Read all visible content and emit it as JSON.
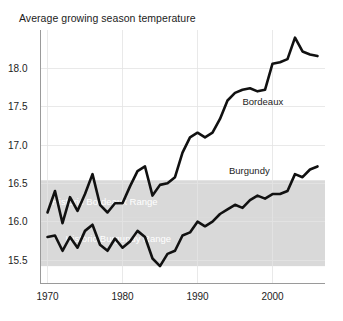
{
  "chart_data": {
    "type": "line",
    "title": "Average growing season temperature",
    "xlabel": "",
    "ylabel": "",
    "xlim": [
      1969,
      2007
    ],
    "ylim": [
      15.2,
      18.5
    ],
    "xticks": [
      1970,
      1980,
      1990,
      2000
    ],
    "xticklabels": [
      "1970",
      "1980",
      "1990",
      "2000"
    ],
    "yticks": [
      15.5,
      16.0,
      16.5,
      17.0,
      17.5,
      18.0
    ],
    "yticklabels": [
      "15.5",
      "16.0",
      "16.5",
      "17.0",
      "17.5",
      "18.0"
    ],
    "grid": true,
    "legend_position": "inline-annotation",
    "bands": [
      {
        "name": "historic-bordeaux-range",
        "label": "Historic Bordeaux Range",
        "ymin": 16.06,
        "ymax": 16.54,
        "color": "#d9d9d9",
        "label_x": 1970.6,
        "label_y": 16.26
      },
      {
        "name": "historic-burgundy-range",
        "label": "Historic Burgundy Range",
        "ymin": 15.42,
        "ymax": 16.06,
        "color": "#d9d9d9",
        "label_x": 1972.4,
        "label_y": 15.77
      }
    ],
    "series": [
      {
        "name": "Bordeaux",
        "label": "Bordeaux",
        "color": "#111111",
        "label_x": 1996.0,
        "label_y": 17.52,
        "x": [
          1970,
          1971,
          1972,
          1973,
          1974,
          1975,
          1976,
          1977,
          1978,
          1979,
          1980,
          1981,
          1982,
          1983,
          1984,
          1985,
          1986,
          1987,
          1988,
          1989,
          1990,
          1991,
          1992,
          1993,
          1994,
          1995,
          1996,
          1997,
          1998,
          1999,
          2000,
          2001,
          2002,
          2003,
          2004,
          2005,
          2006
        ],
        "values": [
          16.12,
          16.4,
          15.98,
          16.32,
          16.14,
          16.36,
          16.62,
          16.22,
          16.12,
          16.24,
          16.24,
          16.46,
          16.66,
          16.72,
          16.34,
          16.48,
          16.5,
          16.58,
          16.9,
          17.1,
          17.16,
          17.1,
          17.16,
          17.34,
          17.58,
          17.68,
          17.72,
          17.74,
          17.7,
          17.72,
          18.06,
          18.08,
          18.12,
          18.4,
          18.22,
          18.18,
          18.16
        ]
      },
      {
        "name": "Burgundy",
        "label": "Burgundy",
        "color": "#111111",
        "label_x": 1994.2,
        "label_y": 16.62,
        "x": [
          1970,
          1971,
          1972,
          1973,
          1974,
          1975,
          1976,
          1977,
          1978,
          1979,
          1980,
          1981,
          1982,
          1983,
          1984,
          1985,
          1986,
          1987,
          1988,
          1989,
          1990,
          1991,
          1992,
          1993,
          1994,
          1995,
          1996,
          1997,
          1998,
          1999,
          2000,
          2001,
          2002,
          2003,
          2004,
          2005,
          2006
        ],
        "values": [
          15.8,
          15.82,
          15.62,
          15.8,
          15.66,
          15.88,
          15.96,
          15.7,
          15.62,
          15.78,
          15.66,
          15.74,
          15.88,
          15.8,
          15.52,
          15.42,
          15.58,
          15.62,
          15.82,
          15.86,
          16.0,
          15.94,
          16.0,
          16.1,
          16.16,
          16.22,
          16.18,
          16.28,
          16.34,
          16.3,
          16.36,
          16.36,
          16.4,
          16.62,
          16.58,
          16.68,
          16.72
        ]
      }
    ]
  }
}
